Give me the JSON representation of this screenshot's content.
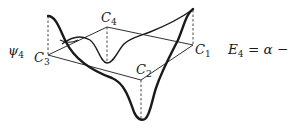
{
  "diagram": {
    "orbital_label": {
      "symbol": "ψ",
      "subscript": "4"
    },
    "energy_label": {
      "lhs": "E",
      "lhs_subscript": "4",
      "rhs": "= α − 2β"
    },
    "atoms": [
      {
        "id": "C1",
        "symbol": "C",
        "subscript": "1"
      },
      {
        "id": "C2",
        "symbol": "C",
        "subscript": "2"
      },
      {
        "id": "C3",
        "symbol": "C",
        "subscript": "3"
      },
      {
        "id": "C4",
        "symbol": "C",
        "subscript": "4"
      }
    ],
    "lobes": [
      {
        "atom": "C1",
        "direction": "up"
      },
      {
        "atom": "C2",
        "direction": "down"
      },
      {
        "atom": "C3",
        "direction": "up"
      },
      {
        "atom": "C4",
        "direction": "down"
      }
    ],
    "colors": {
      "line": "#1a1a1a",
      "background": "#ffffff"
    }
  }
}
